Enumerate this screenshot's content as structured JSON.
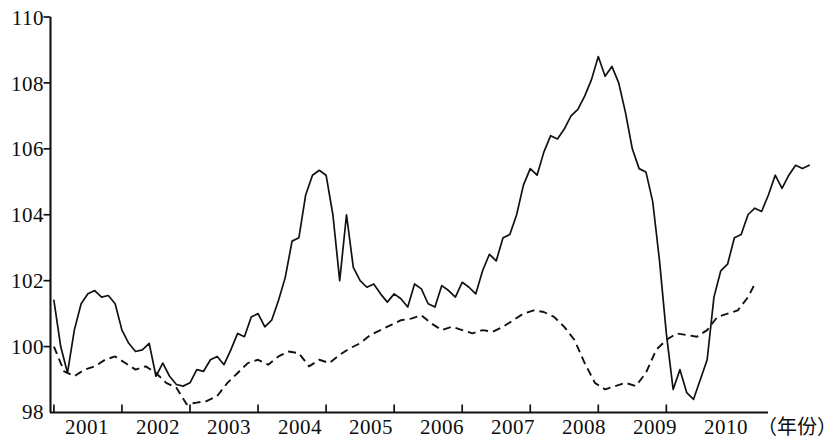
{
  "chart_data": {
    "type": "line",
    "title": "",
    "xlabel": "（年份）",
    "ylabel": "",
    "ylim": [
      98,
      110
    ],
    "xlim": [
      2000.5,
      2011.0
    ],
    "grid": false,
    "legend_position": "none",
    "y_ticks": [
      98,
      100,
      102,
      104,
      106,
      108,
      110
    ],
    "y_tick_labels": [
      "98",
      "100",
      "102",
      "104",
      "106",
      "108",
      "110"
    ],
    "x_ticks": [
      2001,
      2002,
      2003,
      2004,
      2005,
      2006,
      2007,
      2008,
      2009,
      2010
    ],
    "x_tick_labels": [
      "2001",
      "2002",
      "2003",
      "2004",
      "2005",
      "2006",
      "2007",
      "2008",
      "2009",
      "2010"
    ],
    "axis_unit_label": "（年份）",
    "series": [
      {
        "name": "solid-line",
        "style": "solid",
        "color": "#111111",
        "x": [
          2000.55,
          2000.65,
          2000.75,
          2000.85,
          2000.95,
          2001.05,
          2001.15,
          2001.25,
          2001.35,
          2001.45,
          2001.55,
          2001.65,
          2001.75,
          2001.85,
          2001.95,
          2002.05,
          2002.15,
          2002.25,
          2002.35,
          2002.45,
          2002.55,
          2002.65,
          2002.75,
          2002.85,
          2002.95,
          2003.05,
          2003.15,
          2003.25,
          2003.35,
          2003.45,
          2003.55,
          2003.65,
          2003.75,
          2003.85,
          2003.95,
          2004.05,
          2004.15,
          2004.25,
          2004.35,
          2004.45,
          2004.55,
          2004.65,
          2004.75,
          2004.85,
          2004.95,
          2005.05,
          2005.15,
          2005.25,
          2005.35,
          2005.45,
          2005.55,
          2005.65,
          2005.75,
          2005.85,
          2005.95,
          2006.05,
          2006.15,
          2006.25,
          2006.35,
          2006.45,
          2006.55,
          2006.65,
          2006.75,
          2006.85,
          2006.95,
          2007.05,
          2007.15,
          2007.25,
          2007.35,
          2007.45,
          2007.55,
          2007.65,
          2007.75,
          2007.85,
          2007.95,
          2008.05,
          2008.15,
          2008.25,
          2008.35,
          2008.45,
          2008.55,
          2008.65,
          2008.75,
          2008.85,
          2008.95,
          2009.05,
          2009.15,
          2009.25,
          2009.35,
          2009.45,
          2009.55,
          2009.65,
          2009.75,
          2009.85,
          2009.95,
          2010.05,
          2010.15,
          2010.25,
          2010.35,
          2010.45,
          2010.55,
          2010.65,
          2010.75,
          2010.85
        ],
        "values": [
          101.4,
          100.0,
          99.2,
          100.5,
          101.3,
          101.6,
          101.7,
          101.5,
          101.55,
          101.3,
          100.5,
          100.1,
          99.85,
          99.9,
          100.1,
          99.1,
          99.5,
          99.1,
          98.85,
          98.8,
          98.9,
          99.3,
          99.25,
          99.6,
          99.7,
          99.45,
          99.9,
          100.4,
          100.3,
          100.9,
          101.0,
          100.6,
          100.8,
          101.4,
          102.1,
          103.2,
          103.3,
          104.6,
          105.2,
          105.35,
          105.2,
          104.0,
          102.0,
          104.0,
          102.4,
          102.0,
          101.8,
          101.9,
          101.6,
          101.35,
          101.6,
          101.45,
          101.2,
          101.9,
          101.75,
          101.3,
          101.2,
          101.85,
          101.7,
          101.5,
          101.95,
          101.8,
          101.6,
          102.3,
          102.8,
          102.6,
          103.3,
          103.4,
          104.0,
          104.9,
          105.4,
          105.2,
          105.9,
          106.4,
          106.3,
          106.6,
          107.0,
          107.2,
          107.6,
          108.1,
          108.8,
          108.2,
          108.5,
          108.0,
          107.1,
          106.0,
          105.4,
          105.3,
          104.4,
          102.6,
          100.4,
          98.7,
          99.3,
          98.6,
          98.4,
          99.0,
          99.6,
          101.5,
          102.3,
          102.5,
          103.3,
          103.4,
          104.0,
          104.2
        ],
        "values_tail": [
          104.1,
          104.6,
          105.2,
          104.8,
          105.2,
          105.5,
          105.4,
          105.5
        ]
      },
      {
        "name": "dashed-line",
        "style": "dashed",
        "color": "#111111",
        "x": [
          2000.55,
          2000.7,
          2000.85,
          2001.0,
          2001.15,
          2001.3,
          2001.45,
          2001.6,
          2001.75,
          2001.9,
          2002.05,
          2002.2,
          2002.35,
          2002.5,
          2002.65,
          2002.8,
          2002.95,
          2003.1,
          2003.25,
          2003.4,
          2003.55,
          2003.7,
          2003.85,
          2004.0,
          2004.15,
          2004.3,
          2004.45,
          2004.6,
          2004.75,
          2004.9,
          2005.05,
          2005.2,
          2005.35,
          2005.5,
          2005.65,
          2005.8,
          2005.95,
          2006.1,
          2006.25,
          2006.4,
          2006.55,
          2006.7,
          2006.85,
          2007.0,
          2007.15,
          2007.3,
          2007.45,
          2007.6,
          2007.75,
          2007.9,
          2008.05,
          2008.2,
          2008.35,
          2008.5,
          2008.65,
          2008.8,
          2008.95,
          2009.1,
          2009.25,
          2009.4,
          2009.55,
          2009.7,
          2009.85,
          2010.0,
          2010.15,
          2010.3,
          2010.45,
          2010.6,
          2010.75,
          2010.85
        ],
        "values": [
          100.0,
          99.25,
          99.1,
          99.3,
          99.4,
          99.6,
          99.7,
          99.5,
          99.3,
          99.4,
          99.2,
          98.9,
          98.75,
          98.25,
          98.3,
          98.35,
          98.5,
          98.9,
          99.2,
          99.5,
          99.6,
          99.45,
          99.7,
          99.85,
          99.8,
          99.4,
          99.6,
          99.5,
          99.75,
          99.95,
          100.1,
          100.35,
          100.5,
          100.65,
          100.8,
          100.85,
          100.95,
          100.7,
          100.5,
          100.6,
          100.5,
          100.4,
          100.5,
          100.45,
          100.6,
          100.8,
          101.0,
          101.1,
          101.05,
          100.9,
          100.6,
          100.2,
          99.5,
          98.9,
          98.7,
          98.8,
          98.9,
          98.8,
          99.2,
          99.9,
          100.2,
          100.4,
          100.35,
          100.3,
          100.5,
          100.9,
          101.0,
          101.1,
          101.5,
          101.9
        ]
      }
    ]
  },
  "axis": {
    "y_title": "",
    "x_unit": "（年份）"
  }
}
